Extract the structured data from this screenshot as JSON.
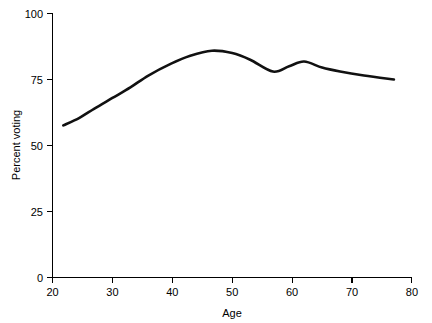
{
  "chart_data": {
    "type": "line",
    "title": "",
    "xlabel": "Age",
    "ylabel": "Percent voting",
    "xlim": [
      20,
      80
    ],
    "ylim": [
      0,
      100
    ],
    "xticks": [
      20,
      30,
      40,
      50,
      60,
      70,
      80
    ],
    "yticks": [
      0,
      25,
      50,
      75,
      100
    ],
    "xtick_labels": [
      "20",
      "30",
      "40",
      "50",
      "60",
      "70",
      "80"
    ],
    "ytick_labels": [
      "0",
      "25",
      "50",
      "75",
      "100"
    ],
    "grid": false,
    "legend": null,
    "series": [
      {
        "name": "Percent voting by age",
        "color": "#111111",
        "x": [
          21.8,
          24.5,
          27.0,
          30.0,
          33.0,
          36.0,
          39.8,
          43.0,
          46.6,
          50.0,
          53.0,
          56.8,
          59.5,
          62.0,
          65.0,
          68.0,
          72.0,
          77.0
        ],
        "y": [
          57.6,
          60.5,
          64.0,
          68.0,
          72.0,
          76.5,
          81.0,
          84.0,
          85.9,
          85.0,
          82.5,
          78.0,
          80.0,
          81.8,
          79.5,
          78.0,
          76.5,
          75.0
        ]
      }
    ]
  },
  "axes": {
    "x_axis_name": "Age",
    "y_axis_name": "Percent voting"
  }
}
